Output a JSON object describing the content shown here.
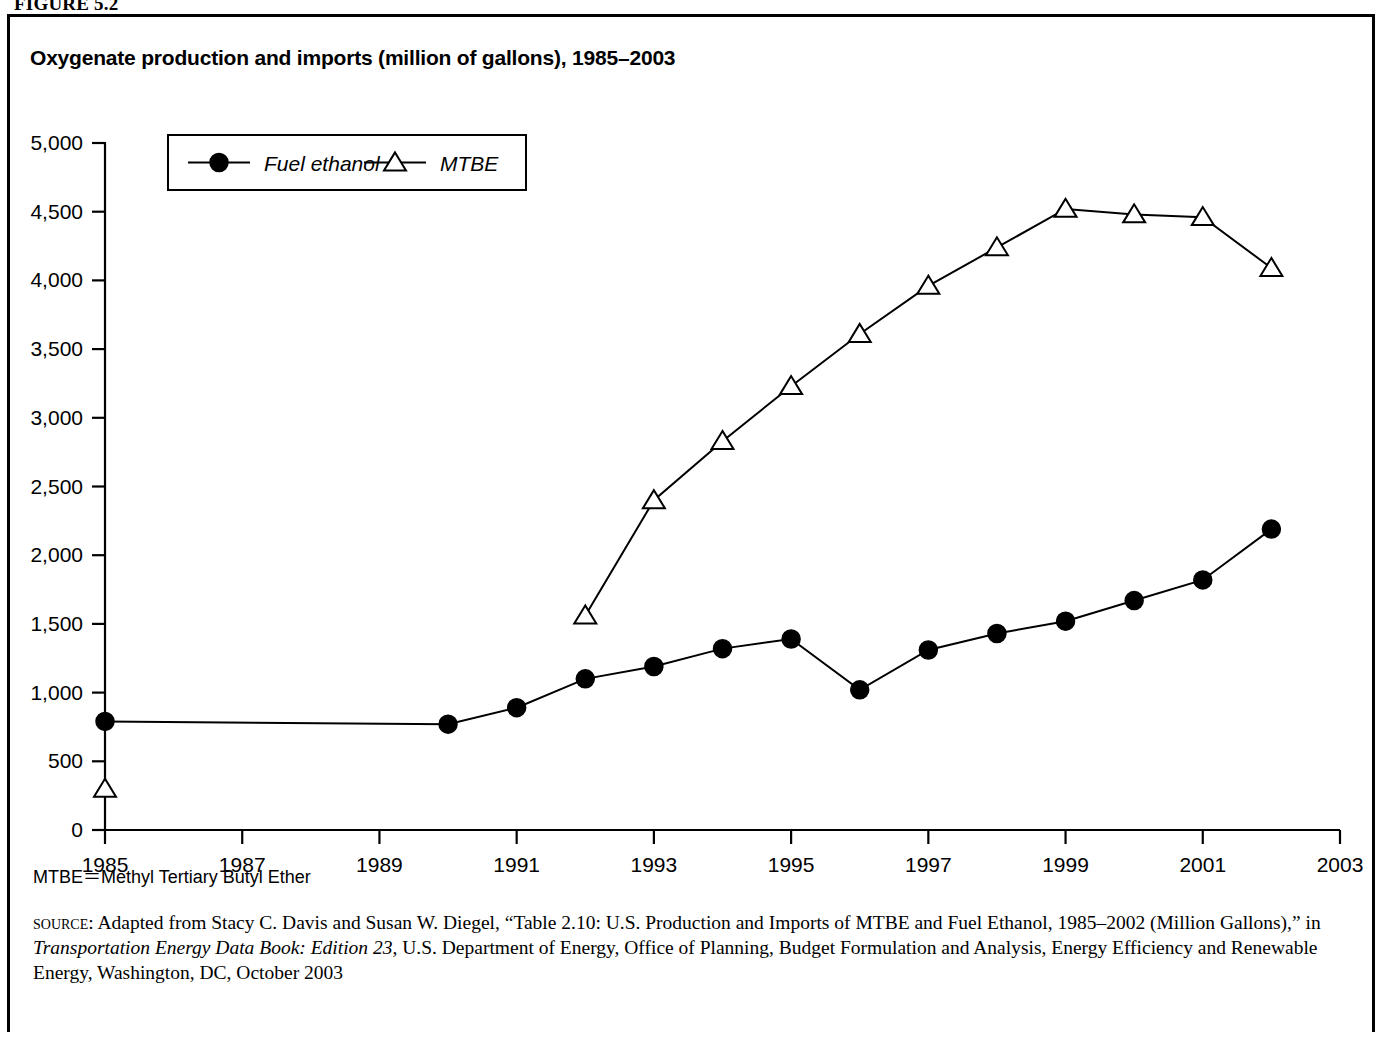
{
  "figure": {
    "label": "FIGURE 5.2"
  },
  "chart_title": "Oxygenate production and imports (million of gallons), 1985–2003",
  "abbreviation_note": "MTBE＝Methyl Tertiary Butyl Ether",
  "source": {
    "prefix": "source",
    "colon": ": ",
    "part1": "Adapted from Stacy C. Davis and Susan W. Diegel, “Table 2.10: U.S. Production and Imports of MTBE and Fuel Ethanol, 1985–2002 (Million Gallons),” in ",
    "italic_title": "Transportation Energy Data Book: Edition 23",
    "part2": ", U.S. Department of Energy, Office of Planning, Budget Formulation and Analysis, Energy Efficiency and Renewable Energy, Washington, DC, October 2003"
  },
  "legend": {
    "items": [
      {
        "label": "Fuel ethanol",
        "marker": "filled-circle"
      },
      {
        "label": "MTBE",
        "marker": "open-triangle"
      }
    ]
  },
  "axes": {
    "y_ticks": [
      "0",
      "500",
      "1,000",
      "1,500",
      "2,000",
      "2,500",
      "3,000",
      "3,500",
      "4,000",
      "4,500",
      "5,000"
    ],
    "x_ticks": [
      "1985",
      "1987",
      "1989",
      "1991",
      "1993",
      "1995",
      "1997",
      "1999",
      "2001",
      "2003"
    ]
  },
  "chart_data": {
    "type": "line",
    "title": "Oxygenate production and imports (million of gallons), 1985–2003",
    "xlabel": "",
    "ylabel": "",
    "xlim": [
      1985,
      2003
    ],
    "ylim": [
      0,
      5000
    ],
    "y_tick_step": 500,
    "x_tick_step": 2,
    "grid": false,
    "legend_position": "top-left-inside",
    "units": "million gallons",
    "series": [
      {
        "name": "Fuel ethanol",
        "marker": "filled-circle",
        "color": "#000000",
        "points": [
          {
            "x": 1985,
            "y": 790
          },
          {
            "x": 1990,
            "y": 770
          },
          {
            "x": 1991,
            "y": 890
          },
          {
            "x": 1992,
            "y": 1100
          },
          {
            "x": 1993,
            "y": 1190
          },
          {
            "x": 1994,
            "y": 1320
          },
          {
            "x": 1995,
            "y": 1390
          },
          {
            "x": 1996,
            "y": 1020
          },
          {
            "x": 1997,
            "y": 1310
          },
          {
            "x": 1998,
            "y": 1430
          },
          {
            "x": 1999,
            "y": 1520
          },
          {
            "x": 2000,
            "y": 1670
          },
          {
            "x": 2001,
            "y": 1820
          },
          {
            "x": 2002,
            "y": 2190
          }
        ]
      },
      {
        "name": "MTBE",
        "marker": "open-triangle",
        "color": "#000000",
        "segments": [
          [
            {
              "x": 1985,
              "y": 300
            }
          ],
          [
            {
              "x": 1992,
              "y": 1560
            },
            {
              "x": 1993,
              "y": 2400
            },
            {
              "x": 1994,
              "y": 2830
            },
            {
              "x": 1995,
              "y": 3230
            },
            {
              "x": 1996,
              "y": 3610
            },
            {
              "x": 1997,
              "y": 3960
            },
            {
              "x": 1998,
              "y": 4240
            },
            {
              "x": 1999,
              "y": 4520
            },
            {
              "x": 2000,
              "y": 4480
            },
            {
              "x": 2001,
              "y": 4460
            },
            {
              "x": 2002,
              "y": 4090
            }
          ]
        ]
      }
    ]
  }
}
